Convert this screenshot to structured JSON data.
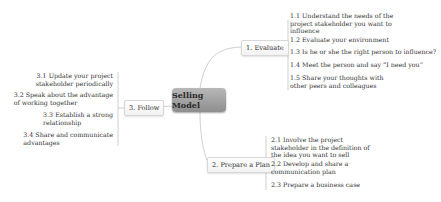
{
  "central": {
    "label": "Selling Model"
  },
  "branches": {
    "evaluate": {
      "label": "1. Evaluate",
      "items": [
        {
          "lines": [
            "1.1 Understand the needs of the",
            "project stakeholder you want to",
            "influence"
          ]
        },
        {
          "lines": [
            "1.2 Evaluate your environment"
          ]
        },
        {
          "lines": [
            "1.3 Is he or she the right person to influence?"
          ]
        },
        {
          "lines": [
            "1.4 Meet the person and say “I need you”"
          ]
        },
        {
          "lines": [
            "1.5 Share your thoughts with",
            "other peers and colleagues"
          ]
        }
      ]
    },
    "plan": {
      "label": "2. Prepare a Plan",
      "items": [
        {
          "lines": [
            "2.1 Involve the project",
            "stakeholder in the definition of",
            "the idea you want to sell"
          ]
        },
        {
          "lines": [
            "2.2 Develop and share a",
            "communication plan"
          ]
        },
        {
          "lines": [
            "2.3 Prepare a business case"
          ]
        }
      ]
    },
    "follow": {
      "label": "3. Follow",
      "items": [
        {
          "lines": [
            "3.1 Update your project",
            "stakeholder periodically"
          ]
        },
        {
          "lines": [
            "3.2 Speak about the advantage",
            "of working together"
          ]
        },
        {
          "lines": [
            "3.3 Establish a strong",
            "relationship"
          ]
        },
        {
          "lines": [
            "3.4 Share and communicate",
            "advantages"
          ]
        }
      ]
    }
  },
  "colors": {
    "central_top": "#b8b8b8",
    "central_bottom": "#8e8e8e",
    "connector": "#d0d0d0",
    "text": "#333333"
  }
}
